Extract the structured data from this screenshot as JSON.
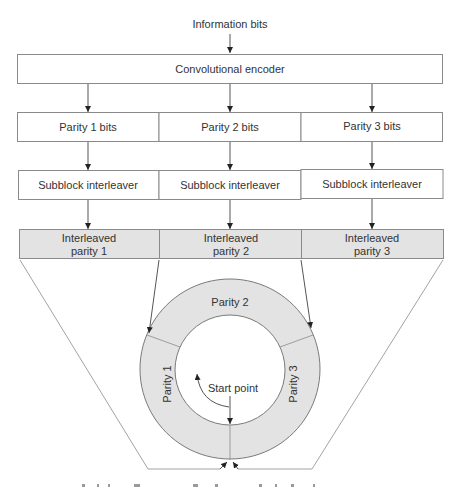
{
  "diagram": {
    "input_label": "Information bits",
    "encoder": {
      "label": "Convolutional encoder"
    },
    "parity_bits": [
      {
        "label": "Parity 1 bits"
      },
      {
        "label": "Parity 2 bits"
      },
      {
        "label": "Parity 3 bits"
      }
    ],
    "interleavers": [
      {
        "label": "Subblock interleaver"
      },
      {
        "label": "Subblock interleaver"
      },
      {
        "label": "Subblock interleaver"
      }
    ],
    "interleaved": [
      {
        "line1": "Interleaved",
        "line2": "parity 1"
      },
      {
        "line1": "Interleaved",
        "line2": "parity 2"
      },
      {
        "line1": "Interleaved",
        "line2": "parity 3"
      }
    ],
    "ring": {
      "segments": [
        {
          "label": "Parity 1"
        },
        {
          "label": "Parity 2"
        },
        {
          "label": "Parity 3"
        }
      ],
      "start_label": "Start point"
    },
    "colors": {
      "shaded_fill": "#e3e3e3",
      "border": "#8a8a8a",
      "arrow": "#333333"
    }
  }
}
